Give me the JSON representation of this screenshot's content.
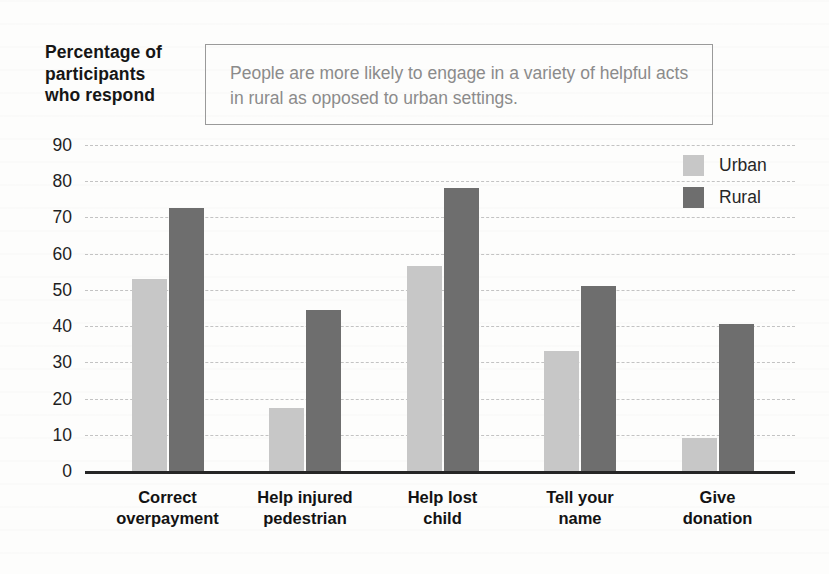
{
  "header": {
    "title": "Percentage of\nparticipants\nwho respond"
  },
  "annotation": {
    "text": "People are more likely to engage in a variety of helpful acts in rural as opposed to urban settings."
  },
  "legend": {
    "items": [
      {
        "label": "Urban",
        "color": "#c7c7c7"
      },
      {
        "label": "Rural",
        "color": "#6e6e6e"
      }
    ]
  },
  "chart_data": {
    "type": "bar",
    "title": "",
    "xlabel": "",
    "ylabel": "Percentage of participants who respond",
    "ylim": [
      0,
      90
    ],
    "yticks": [
      0,
      10,
      20,
      30,
      40,
      50,
      60,
      70,
      80,
      90
    ],
    "grid": "horizontal-dashed",
    "legend_position": "top-right",
    "categories": [
      "Correct\noverpayment",
      "Help injured\npedestrian",
      "Help lost\nchild",
      "Tell your\nname",
      "Give\ndonation"
    ],
    "series": [
      {
        "name": "Urban",
        "color": "#c7c7c7",
        "values": [
          53,
          17.5,
          56.5,
          33,
          9
        ]
      },
      {
        "name": "Rural",
        "color": "#6e6e6e",
        "values": [
          72.5,
          44.5,
          78,
          51,
          40.5
        ]
      }
    ]
  }
}
